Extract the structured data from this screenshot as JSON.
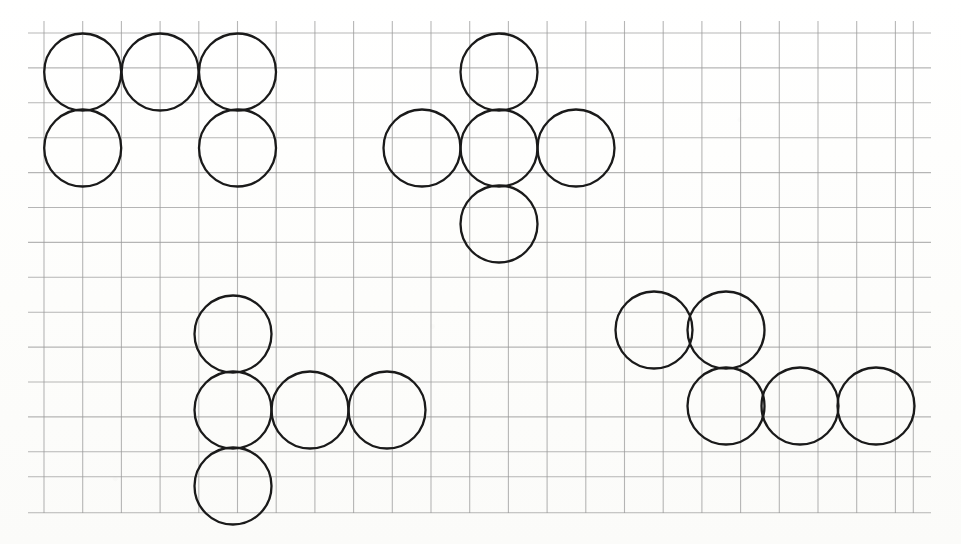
{
  "canvas": {
    "width": 961,
    "height": 544,
    "background_color": "#fdfdfc",
    "description": "Graph-paper worksheet with four clusters of outlined circles forming tetromino/pentomino-like shapes"
  },
  "grid": {
    "line_color": "#9a9a9a",
    "line_width": 1.1,
    "cell_width": 38.7,
    "cell_height": 34.9,
    "origin_x": 44,
    "origin_y": 33,
    "vertical_line_count": 24,
    "horizontal_line_count": 15,
    "vertical_line_top": 21,
    "vertical_line_bottom": 513,
    "horizontal_line_left": 28,
    "horizontal_line_right": 931,
    "vertical_lines_x": [
      44,
      82.7,
      121.4,
      160.1,
      198.8,
      237.5,
      276.2,
      314.9,
      353.6,
      392.3,
      431,
      469.7,
      508.4,
      547.1,
      585.8,
      624.5,
      663.2,
      701.9,
      740.6,
      779.3,
      818,
      856.7,
      895.4,
      913.3
    ],
    "horizontal_lines_y": [
      33,
      67.9,
      102.8,
      137.7,
      172.6,
      207.5,
      242.4,
      277.3,
      312.2,
      347.1,
      382,
      416.9,
      451.8,
      476.7,
      512.7
    ]
  },
  "circles": {
    "stroke_color": "#1a1a1a",
    "stroke_width": 2.3,
    "fill": "none",
    "radius": 38.5,
    "diameter": 77,
    "count": 16
  },
  "clusters": [
    {
      "id": "cluster-top-left",
      "name": "P-pentomino cluster (top left)",
      "circle_count": 5,
      "circles": [
        {
          "id": "tl-1",
          "cx": 82.7,
          "cy": 72,
          "label": "top-row-left"
        },
        {
          "id": "tl-2",
          "cx": 160.1,
          "cy": 72,
          "label": "top-row-middle"
        },
        {
          "id": "tl-3",
          "cx": 237.5,
          "cy": 72,
          "label": "top-row-right"
        },
        {
          "id": "tl-4",
          "cx": 82.7,
          "cy": 148,
          "label": "bottom-row-left"
        },
        {
          "id": "tl-5",
          "cx": 237.5,
          "cy": 148,
          "label": "bottom-row-right"
        }
      ]
    },
    {
      "id": "cluster-top-middle",
      "name": "Plus / cross cluster (top middle)",
      "circle_count": 5,
      "circles": [
        {
          "id": "tm-1",
          "cx": 499,
          "cy": 72,
          "label": "top"
        },
        {
          "id": "tm-2",
          "cx": 422,
          "cy": 148,
          "label": "left"
        },
        {
          "id": "tm-3",
          "cx": 499,
          "cy": 148,
          "label": "center"
        },
        {
          "id": "tm-4",
          "cx": 576,
          "cy": 148,
          "label": "right"
        },
        {
          "id": "tm-5",
          "cx": 499,
          "cy": 224,
          "label": "bottom"
        }
      ]
    },
    {
      "id": "cluster-bottom-left",
      "name": "T-rotated cluster (bottom left)",
      "circle_count": 5,
      "circles": [
        {
          "id": "bl-1",
          "cx": 233,
          "cy": 334,
          "label": "column-top"
        },
        {
          "id": "bl-2",
          "cx": 233,
          "cy": 410,
          "label": "column-middle"
        },
        {
          "id": "bl-3",
          "cx": 310,
          "cy": 410,
          "label": "arm-middle"
        },
        {
          "id": "bl-4",
          "cx": 387,
          "cy": 410,
          "label": "arm-right"
        },
        {
          "id": "bl-5",
          "cx": 233,
          "cy": 486,
          "label": "column-bottom"
        }
      ]
    },
    {
      "id": "cluster-bottom-right",
      "name": "S / Z cluster (bottom right)",
      "circle_count": 5,
      "circles": [
        {
          "id": "br-1",
          "cx": 654,
          "cy": 330,
          "label": "top-left"
        },
        {
          "id": "br-2",
          "cx": 726,
          "cy": 330,
          "label": "top-right"
        },
        {
          "id": "br-3",
          "cx": 726,
          "cy": 406,
          "label": "bottom-left"
        },
        {
          "id": "br-4",
          "cx": 800,
          "cy": 406,
          "label": "bottom-middle"
        },
        {
          "id": "br-5",
          "cx": 876,
          "cy": 406,
          "label": "bottom-right"
        }
      ]
    }
  ]
}
